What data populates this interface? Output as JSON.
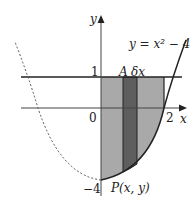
{
  "diagram": {
    "curve_label": "y = x² − 4",
    "axis_x_label": "x",
    "axis_y_label": "y",
    "tick_y_top": "1",
    "tick_origin": "0",
    "tick_x_right": "2",
    "tick_y_bottom": "−4",
    "point_label": "P(x, y)",
    "point_A_label": "A",
    "strip_label": "δx",
    "colors": {
      "region_fill": "#a9a9a9",
      "strip_fill": "#5e5e5e",
      "line": "#222222"
    }
  }
}
